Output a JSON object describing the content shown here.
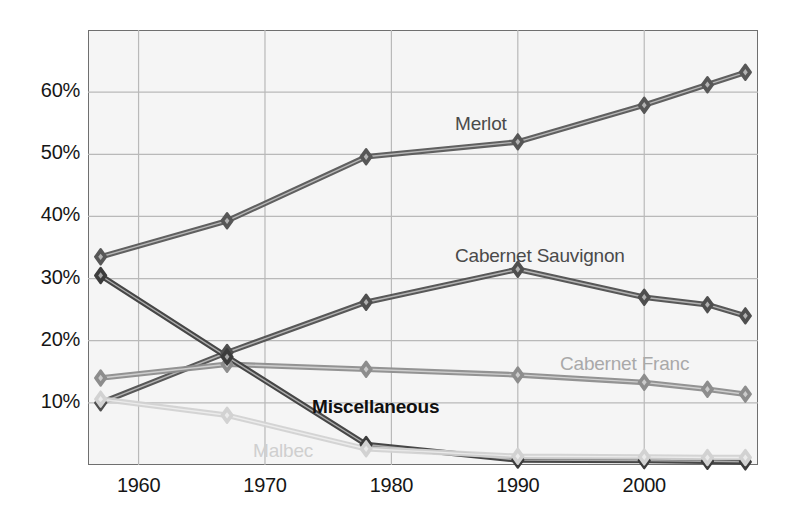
{
  "chart_data": {
    "type": "line",
    "title": "",
    "xlabel": "",
    "ylabel": "",
    "x": [
      1957,
      1967,
      1978,
      1989,
      1990,
      2000,
      2005,
      2008
    ],
    "x_ticks": [
      "1960",
      "1970",
      "1980",
      "1990",
      "2000"
    ],
    "x_tick_values": [
      1960,
      1970,
      1980,
      1990,
      2000
    ],
    "y_ticks": [
      "10%",
      "20%",
      "30%",
      "40%",
      "50%",
      "60%"
    ],
    "y_tick_values": [
      10,
      20,
      30,
      40,
      50,
      60
    ],
    "xlim": [
      1956,
      2009
    ],
    "ylim": [
      0,
      70
    ],
    "grid": true,
    "legend": "inline-labels",
    "marker": "diamond",
    "series": [
      {
        "name": "Merlot",
        "color": "#575757",
        "label_x": 455,
        "label_y": 113,
        "points": [
          {
            "x": 1957,
            "y": 33.5
          },
          {
            "x": 1967,
            "y": 39.3
          },
          {
            "x": 1978,
            "y": 49.6
          },
          {
            "x": 1990,
            "y": 52.0
          },
          {
            "x": 2000,
            "y": 57.9
          },
          {
            "x": 2005,
            "y": 61.2
          },
          {
            "x": 2008,
            "y": 63.2
          }
        ]
      },
      {
        "name": "Cabernet Sauvignon",
        "color": "#4f4f4f",
        "label_x": 455,
        "label_y": 245,
        "points": [
          {
            "x": 1957,
            "y": 10.0
          },
          {
            "x": 1967,
            "y": 18.1
          },
          {
            "x": 1978,
            "y": 26.2
          },
          {
            "x": 1990,
            "y": 31.5
          },
          {
            "x": 2000,
            "y": 27.0
          },
          {
            "x": 2005,
            "y": 25.8
          },
          {
            "x": 2008,
            "y": 24.0
          }
        ]
      },
      {
        "name": "Cabernet Franc",
        "color": "#8d8d8d",
        "label_x": 560,
        "label_y": 353,
        "points": [
          {
            "x": 1957,
            "y": 14.0
          },
          {
            "x": 1967,
            "y": 16.2
          },
          {
            "x": 1978,
            "y": 15.4
          },
          {
            "x": 1990,
            "y": 14.5
          },
          {
            "x": 2000,
            "y": 13.3
          },
          {
            "x": 2005,
            "y": 12.2
          },
          {
            "x": 2008,
            "y": 11.4
          }
        ]
      },
      {
        "name": "Miscellaneous",
        "color": "#3c3c3c",
        "label_x": 312,
        "label_y": 396,
        "points": [
          {
            "x": 1957,
            "y": 30.5
          },
          {
            "x": 1967,
            "y": 17.4
          },
          {
            "x": 1978,
            "y": 3.3
          },
          {
            "x": 1990,
            "y": 0.8
          },
          {
            "x": 2000,
            "y": 0.7
          },
          {
            "x": 2005,
            "y": 0.6
          },
          {
            "x": 2008,
            "y": 0.5
          }
        ]
      },
      {
        "name": "Malbec",
        "color": "#d2d2d2",
        "label_x": 253,
        "label_y": 440,
        "points": [
          {
            "x": 1957,
            "y": 10.6
          },
          {
            "x": 1967,
            "y": 8.0
          },
          {
            "x": 1978,
            "y": 2.6
          },
          {
            "x": 1990,
            "y": 1.4
          },
          {
            "x": 2000,
            "y": 1.3
          },
          {
            "x": 2005,
            "y": 1.2
          },
          {
            "x": 2008,
            "y": 1.2
          }
        ]
      }
    ],
    "colors": {
      "plot_background": "#f5f5f5",
      "page_background": "#ffffff",
      "grid": "#b9b9b9",
      "axis_border": "#6f6f6f",
      "tick_text": "#161616"
    }
  }
}
